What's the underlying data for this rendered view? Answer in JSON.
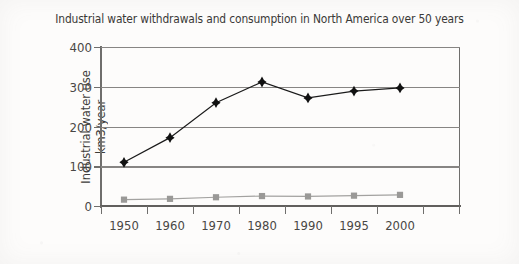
{
  "chart_data": {
    "type": "line",
    "title": "Industrial water withdrawals and consumption in North America over 50 years",
    "xlabel": "",
    "ylabel": "Industrial water use km3/year",
    "ylabel_lines": [
      "Industrial water use",
      "km3/year"
    ],
    "categories": [
      "1950",
      "1960",
      "1970",
      "1980",
      "1990",
      "1995",
      "2000"
    ],
    "ylim": [
      0,
      400
    ],
    "yticks": [
      0,
      100,
      200,
      300,
      400
    ],
    "ytick_labels": [
      "0",
      "100",
      "200",
      "300",
      "400"
    ],
    "grid": "horizontal",
    "legend": "none",
    "series": [
      {
        "name": "Industrial water withdrawals",
        "marker": "diamond",
        "color": "#111111",
        "values": [
          110,
          172,
          260,
          312,
          272,
          289,
          297
        ]
      },
      {
        "name": "Industrial water consumption",
        "marker": "square",
        "color": "#9a9997",
        "values": [
          16,
          18,
          22,
          25,
          24,
          26,
          28
        ]
      }
    ]
  },
  "figure": {
    "title": "Industrial water withdrawals and consumption in North America over 50 years",
    "axis": {
      "y_title_line1": "Industrial water use",
      "y_title_line2": "km3/year"
    }
  }
}
